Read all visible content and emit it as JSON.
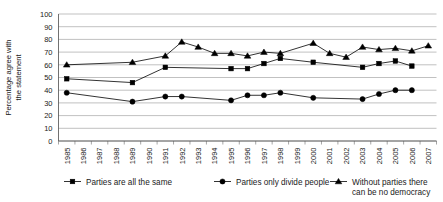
{
  "chart_data": {
    "type": "line",
    "title": "",
    "xlabel": "",
    "ylabel": "Percentage agree with the statement",
    "ylim": [
      0,
      100
    ],
    "ytick_step": 10,
    "yticks": [
      0,
      10,
      20,
      30,
      40,
      50,
      60,
      70,
      80,
      90,
      100
    ],
    "grid": true,
    "legend_position": "bottom",
    "categories": [
      "1985",
      "1986",
      "1987",
      "1988",
      "1989",
      "1990",
      "1991",
      "1992",
      "1993",
      "1994",
      "1995",
      "1996",
      "1997",
      "1998",
      "1999",
      "2000",
      "2001",
      "2002",
      "2003",
      "2004",
      "2005",
      "2006",
      "2007"
    ],
    "series": [
      {
        "name": "Parties are all the same",
        "marker": "square",
        "values": [
          49,
          null,
          null,
          null,
          46,
          null,
          58,
          null,
          null,
          null,
          57,
          57,
          61,
          65,
          null,
          62,
          null,
          null,
          58,
          61,
          63,
          59,
          null
        ]
      },
      {
        "name": "Parties only divide people",
        "marker": "circle",
        "values": [
          38,
          null,
          null,
          null,
          31,
          null,
          35,
          35,
          null,
          null,
          32,
          36,
          36,
          38,
          null,
          34,
          null,
          null,
          33,
          37,
          40,
          40,
          null
        ]
      },
      {
        "name": "Without parties there can be no democracy",
        "marker": "triangle",
        "values": [
          60,
          null,
          null,
          null,
          62,
          null,
          67,
          78,
          74,
          69,
          69,
          67,
          70,
          69,
          null,
          77,
          69,
          66,
          74,
          72,
          73,
          71,
          75
        ]
      }
    ]
  },
  "legend": {
    "items": [
      {
        "label": "Parties are all the same",
        "marker": "square"
      },
      {
        "label": "Parties only divide people",
        "marker": "circle"
      },
      {
        "label_line1": "Without parties there",
        "label_line2": "can be no democracy",
        "marker": "triangle"
      }
    ]
  },
  "colors": {
    "series": "#000000",
    "grid": "#a6a6a6",
    "axis": "#4d4d4d",
    "text": "#1a1a1a",
    "background": "#ffffff"
  }
}
